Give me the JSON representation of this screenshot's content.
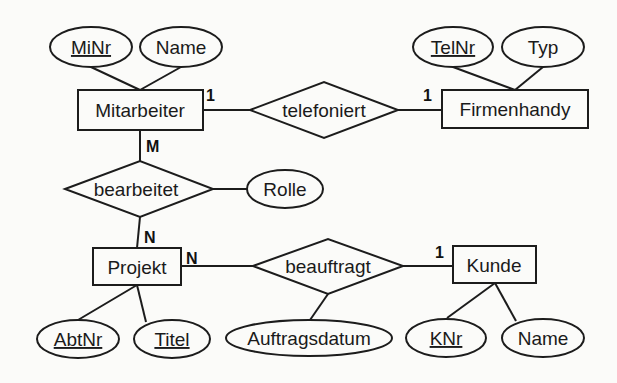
{
  "diagram": {
    "type": "er-diagram",
    "entities": {
      "mitarbeiter": {
        "label": "Mitarbeiter"
      },
      "firmenhandy": {
        "label": "Firmenhandy"
      },
      "projekt": {
        "label": "Projekt"
      },
      "kunde": {
        "label": "Kunde"
      }
    },
    "relationships": {
      "telefoniert": {
        "label": "telefoniert",
        "card_left": "1",
        "card_right": "1"
      },
      "bearbeitet": {
        "label": "bearbeitet",
        "card_top": "M",
        "card_bottom": "N"
      },
      "beauftragt": {
        "label": "beauftragt",
        "card_left": "N",
        "card_right": "1"
      }
    },
    "attributes": {
      "mitarbeiter_minr": {
        "label": "MiNr",
        "key": true
      },
      "mitarbeiter_name": {
        "label": "Name",
        "key": false
      },
      "firmenhandy_telnr": {
        "label": "TelNr",
        "key": true
      },
      "firmenhandy_typ": {
        "label": "Typ",
        "key": false
      },
      "bearbeitet_rolle": {
        "label": "Rolle",
        "key": false
      },
      "projekt_abtnr": {
        "label": "AbtNr",
        "key": true
      },
      "projekt_titel": {
        "label": "Titel",
        "key": true
      },
      "beauftragt_auftragsdatum": {
        "label": "Auftragsdatum",
        "key": false
      },
      "kunde_knr": {
        "label": "KNr",
        "key": true
      },
      "kunde_name": {
        "label": "Name",
        "key": false
      }
    }
  }
}
